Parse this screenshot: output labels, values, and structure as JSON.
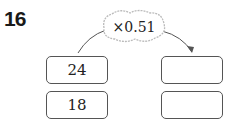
{
  "problem_number": "16",
  "operator": "×0.51",
  "inputs": [
    "24",
    "18"
  ],
  "outputs": [
    "",
    ""
  ]
}
